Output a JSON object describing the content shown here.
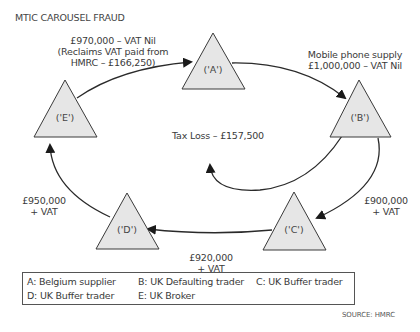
{
  "title": "MTIC CAROUSEL FRAUD",
  "nodes": [
    {
      "id": "A",
      "label": "('A')"
    },
    {
      "id": "B",
      "label": "('B')"
    },
    {
      "id": "C",
      "label": "('C')"
    },
    {
      "id": "D",
      "label": "('D')"
    },
    {
      "id": "E",
      "label": "('E')"
    }
  ],
  "edges": {
    "a_to_b": {
      "line1": "Mobile phone supply",
      "line2": "£1,000,000 – VAT Nil"
    },
    "b_to_c": {
      "line1": "£900,000",
      "line2": "+ VAT"
    },
    "c_to_d": {
      "line1": "£920,000",
      "line2": "+ VAT"
    },
    "d_to_e": {
      "line1": "£950,000",
      "line2": "+ VAT"
    },
    "e_to_a": {
      "line1": "£970,000 – VAT Nil",
      "line2": "(Reclaims VAT paid from",
      "line3": "HMRC – £166,250)"
    },
    "b_tax_loss": {
      "label": "Tax Loss – £157,500"
    }
  },
  "legend": [
    "A: Belgium supplier",
    "B: UK Defaulting trader",
    "C: UK Buffer trader",
    "D: UK Buffer trader",
    "E: UK Broker"
  ],
  "source": "SOURCE: HMRC",
  "colors": {
    "triangle_fill": "#e6e6e6",
    "stroke": "#2a2a2a",
    "text": "#3a3a3a"
  }
}
